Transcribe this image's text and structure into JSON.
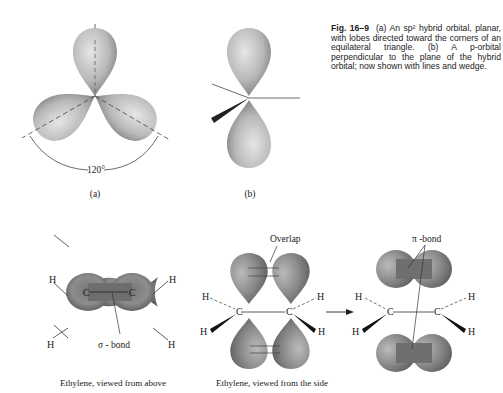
{
  "caption": {
    "fig_label": "Fig. 16–9",
    "text": "(a) An sp² hybrid orbital, planar, with lobes directed toward the corners of an equilateral triangle. (b) A p-orbital perpendicular to the plane of the hybrid orbital; now shown with lines and wedge."
  },
  "panel_a": {
    "label": "(a)",
    "angle": "120°"
  },
  "panel_b": {
    "label": "(b)"
  },
  "ethylene_above": {
    "caption": "Ethylene, viewed from above",
    "sigma_label": "σ - bond",
    "carbon": "C",
    "hydrogen": "H"
  },
  "ethylene_side": {
    "caption": "Ethylene, viewed from the side",
    "overlap_label": "Overlap",
    "pi_label": "π -bond",
    "carbon": "C",
    "hydrogen": "H"
  }
}
